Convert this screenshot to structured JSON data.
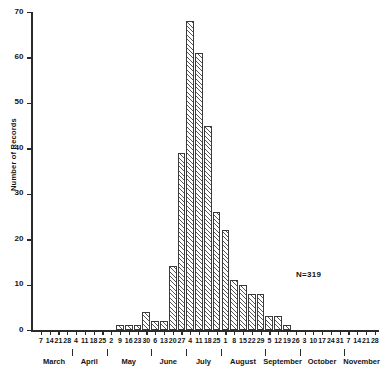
{
  "chart_data": {
    "type": "bar",
    "title": "",
    "xlabel": "",
    "ylabel": "Number of Records",
    "ylim": [
      0,
      70
    ],
    "ytick_values": [
      0,
      10,
      20,
      30,
      40,
      50,
      60,
      70
    ],
    "ytick_labels": [
      "0",
      "10",
      "20",
      "30",
      "40",
      "50",
      "60",
      "70"
    ],
    "grid": false,
    "legend": null,
    "annotations": [
      {
        "text": "N=319",
        "x": "September",
        "y": 14
      }
    ],
    "categories": [
      "7",
      "14",
      "21",
      "28",
      "4",
      "11",
      "18",
      "25",
      "2",
      "9",
      "16",
      "23",
      "30",
      "6",
      "13",
      "20",
      "27",
      "4",
      "11",
      "18",
      "25",
      "1",
      "8",
      "15",
      "22",
      "29",
      "5",
      "12",
      "19",
      "26",
      "3",
      "10",
      "17",
      "24",
      "31",
      "7",
      "14",
      "21",
      "28"
    ],
    "values": [
      0,
      0,
      0,
      0,
      0,
      0,
      0,
      0,
      0,
      1,
      1,
      1,
      4,
      2,
      2,
      14,
      39,
      68,
      61,
      45,
      26,
      22,
      11,
      10,
      8,
      8,
      3,
      3,
      1,
      0,
      0,
      0,
      0,
      0,
      0,
      0,
      0,
      0,
      0
    ],
    "months": [
      {
        "label": "March",
        "start_index": 0,
        "count": 4
      },
      {
        "label": "April",
        "start_index": 4,
        "count": 4
      },
      {
        "label": "May",
        "start_index": 8,
        "count": 5
      },
      {
        "label": "June",
        "start_index": 13,
        "count": 4
      },
      {
        "label": "July",
        "start_index": 17,
        "count": 4
      },
      {
        "label": "August",
        "start_index": 21,
        "count": 5
      },
      {
        "label": "September",
        "start_index": 26,
        "count": 4
      },
      {
        "label": "October",
        "start_index": 30,
        "count": 5
      },
      {
        "label": "November",
        "start_index": 35,
        "count": 4
      }
    ],
    "colors": {
      "ink": "#2a2a2a",
      "bar_edge": "#3a3a3a",
      "bar_hatch": "#555555",
      "background": "#ffffff"
    }
  },
  "caption": {
    "text": ""
  }
}
